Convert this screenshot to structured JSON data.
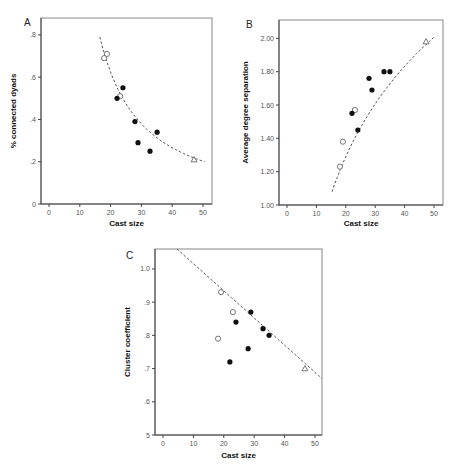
{
  "chart_data": [
    {
      "panel": "A",
      "type": "scatter",
      "title": "",
      "xlabel": "Cast size",
      "ylabel": "% connected dyads",
      "xlim": [
        -3,
        53
      ],
      "ylim": [
        0,
        0.88
      ],
      "xticks": [
        0,
        10,
        20,
        30,
        40,
        50
      ],
      "xtick_labels": [
        "0",
        "10",
        "20",
        "30",
        "40",
        "50"
      ],
      "yticks": [
        0,
        0.2,
        0.4,
        0.6,
        0.8
      ],
      "ytick_labels": [
        "0",
        ".2",
        ".4",
        ".6",
        ".8"
      ],
      "grid": false,
      "fit": {
        "type": "power-decay",
        "style": "dashed",
        "from": [
          16.5,
          0.79
        ],
        "to": [
          50.5,
          0.2
        ]
      },
      "series": [
        {
          "name": "open-circle",
          "marker": "open-circle",
          "points": [
            [
              18.8,
              0.71
            ],
            [
              17.9,
              0.69
            ],
            [
              23.1,
              0.51
            ]
          ]
        },
        {
          "name": "filled-circle",
          "marker": "filled-circle",
          "points": [
            [
              24.0,
              0.55
            ],
            [
              22.1,
              0.5
            ],
            [
              27.9,
              0.39
            ],
            [
              35.1,
              0.34
            ],
            [
              28.9,
              0.29
            ],
            [
              32.8,
              0.25
            ]
          ]
        },
        {
          "name": "open-triangle",
          "marker": "open-triangle",
          "points": [
            [
              47.1,
              0.21
            ]
          ]
        }
      ]
    },
    {
      "panel": "B",
      "type": "scatter",
      "title": "",
      "xlabel": "Cast size",
      "ylabel": "Average degree separation",
      "xlim": [
        -3,
        53
      ],
      "ylim": [
        1.0,
        2.11
      ],
      "xticks": [
        0,
        10,
        20,
        30,
        40,
        50
      ],
      "xtick_labels": [
        "0",
        "10",
        "20",
        "30",
        "40",
        "50"
      ],
      "yticks": [
        1.0,
        1.2,
        1.4,
        1.6,
        1.8,
        2.0
      ],
      "ytick_labels": [
        "1.00",
        "1.20",
        "1.40",
        "1.60",
        "1.80",
        "2.00"
      ],
      "grid": false,
      "fit": {
        "type": "logarithmic",
        "style": "dashed",
        "from": [
          15.3,
          1.08
        ],
        "to": [
          50.2,
          2.01
        ]
      },
      "series": [
        {
          "name": "open-circle",
          "marker": "open-circle",
          "points": [
            [
              23.1,
              1.57
            ],
            [
              19.0,
              1.38
            ],
            [
              18.0,
              1.23
            ]
          ]
        },
        {
          "name": "filled-circle",
          "marker": "filled-circle",
          "points": [
            [
              33.0,
              1.8
            ],
            [
              35.0,
              1.8
            ],
            [
              27.9,
              1.76
            ],
            [
              28.9,
              1.69
            ],
            [
              22.1,
              1.55
            ],
            [
              24.1,
              1.45
            ]
          ]
        },
        {
          "name": "open-triangle",
          "marker": "open-triangle",
          "points": [
            [
              47.3,
              1.98
            ]
          ]
        }
      ]
    },
    {
      "panel": "C",
      "type": "scatter",
      "title": "",
      "xlabel": "Cast size",
      "ylabel": "Cluster coefficient",
      "xlim": [
        -3,
        53
      ],
      "ylim": [
        0.5,
        1.06
      ],
      "xticks": [
        0,
        10,
        20,
        30,
        40,
        50
      ],
      "xtick_labels": [
        "0",
        "10",
        "20",
        "30",
        "40",
        "50"
      ],
      "yticks": [
        0.5,
        0.6,
        0.7,
        0.8,
        0.9,
        1.0
      ],
      "ytick_labels": [
        "5",
        ".6",
        ".7",
        ".8",
        ".9",
        "1.0"
      ],
      "grid": false,
      "fit": {
        "type": "linear",
        "style": "dashed",
        "from": [
          4.6,
          1.06
        ],
        "to": [
          52.3,
          0.67
        ]
      },
      "series": [
        {
          "name": "open-circle",
          "marker": "open-circle",
          "points": [
            [
              19.1,
              0.93
            ],
            [
              23.0,
              0.87
            ],
            [
              18.1,
              0.79
            ]
          ]
        },
        {
          "name": "filled-circle",
          "marker": "filled-circle",
          "points": [
            [
              28.9,
              0.87
            ],
            [
              24.0,
              0.84
            ],
            [
              32.9,
              0.82
            ],
            [
              34.9,
              0.8
            ],
            [
              28.0,
              0.76
            ],
            [
              22.0,
              0.72
            ]
          ]
        },
        {
          "name": "open-triangle",
          "marker": "open-triangle",
          "points": [
            [
              46.7,
              0.7
            ]
          ]
        }
      ]
    }
  ],
  "layout": [
    {
      "left": 41,
      "top": 18,
      "right": 212,
      "bottom": 204,
      "x0px": 49,
      "x50px": 203,
      "letter_pos": [
        24,
        26
      ],
      "ylabel_x": 16,
      "xlabel_y": 226
    },
    {
      "left": 279,
      "top": 20,
      "right": 443,
      "bottom": 205,
      "x0px": 287,
      "x50px": 434,
      "letter_pos": [
        246,
        28
      ],
      "ylabel_x": 248,
      "xlabel_y": 226
    },
    {
      "left": 155,
      "top": 249,
      "right": 322,
      "bottom": 435,
      "x0px": 163,
      "x50px": 315,
      "letter_pos": [
        126,
        259
      ],
      "ylabel_x": 130,
      "xlabel_y": 458
    }
  ],
  "colors": {
    "marker": "#111111",
    "frame": "#888888",
    "fit": "#555555"
  }
}
